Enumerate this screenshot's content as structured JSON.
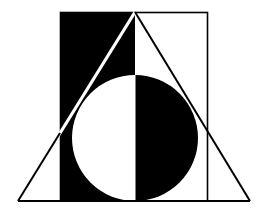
{
  "logo": {
    "description": "Geometric emblem: half-black rectangle, circle split black/white, enclosing triangle",
    "colors": {
      "ink": "#000000",
      "paper": "#ffffff"
    },
    "rect": {
      "x": 60,
      "y": 12,
      "w": 148,
      "h": 189
    },
    "split_x": 135,
    "circle": {
      "cx": 135,
      "cy": 138,
      "r": 63
    },
    "triangle": {
      "apex": [
        135,
        12
      ],
      "left": [
        18,
        201
      ],
      "right": [
        250,
        201
      ]
    }
  }
}
